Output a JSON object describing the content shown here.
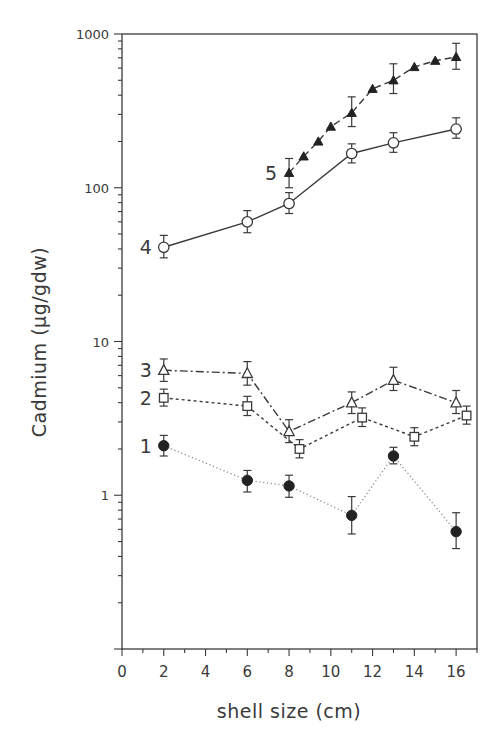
{
  "chart_data": {
    "type": "line",
    "title": "",
    "xlabel": "shell size (cm)",
    "ylabel": "Cadmium (μg/gdw)",
    "xlim": [
      0,
      17
    ],
    "ylim": [
      0.1,
      1000
    ],
    "yscale": "log",
    "grid": false,
    "legend": "inline numeric labels at left of each series",
    "x_ticks": [
      0,
      2,
      4,
      6,
      8,
      10,
      12,
      14,
      16
    ],
    "x_tick_labels": [
      "0",
      "2",
      "4",
      "6",
      "8",
      "10",
      "12",
      "14",
      "16"
    ],
    "y_ticks": [
      1,
      10,
      100,
      1000
    ],
    "y_tick_labels": [
      "1",
      "10",
      "100",
      "1000"
    ],
    "series": [
      {
        "name": "1",
        "marker": "filled-circle",
        "line_style": "sparse-dotted",
        "x": [
          2,
          6,
          8,
          11,
          13,
          16
        ],
        "values": [
          2.1,
          1.25,
          1.15,
          0.74,
          1.8,
          0.58
        ],
        "error_low": [
          1.8,
          1.05,
          0.97,
          0.56,
          1.6,
          0.45
        ],
        "error_high": [
          2.45,
          1.45,
          1.35,
          0.98,
          2.05,
          0.77
        ]
      },
      {
        "name": "2",
        "marker": "open-square",
        "line_style": "dotted",
        "x": [
          2,
          6,
          8.5,
          11.5,
          14,
          16.5
        ],
        "values": [
          4.3,
          3.8,
          2.0,
          3.2,
          2.4,
          3.3
        ],
        "error_low": [
          3.8,
          3.3,
          1.75,
          2.8,
          2.1,
          2.9
        ],
        "error_high": [
          4.9,
          4.4,
          2.3,
          3.7,
          2.75,
          3.8
        ]
      },
      {
        "name": "3",
        "marker": "open-triangle",
        "line_style": "dash-dot",
        "x": [
          2,
          6,
          8,
          11,
          13,
          16
        ],
        "values": [
          6.5,
          6.2,
          2.6,
          4.0,
          5.6,
          4.0
        ],
        "error_low": [
          5.5,
          5.2,
          2.2,
          3.4,
          4.8,
          3.4
        ],
        "error_high": [
          7.7,
          7.4,
          3.1,
          4.7,
          6.8,
          4.8
        ]
      },
      {
        "name": "4",
        "marker": "open-circle",
        "line_style": "solid",
        "x": [
          2,
          6,
          8,
          11,
          13,
          16
        ],
        "values": [
          41,
          60,
          79,
          167,
          196,
          241
        ],
        "error_low": [
          35,
          51,
          68,
          145,
          170,
          210
        ],
        "error_high": [
          49,
          71,
          93,
          193,
          228,
          285
        ]
      },
      {
        "name": "5",
        "marker": "filled-triangle",
        "line_style": "dashed",
        "x": [
          8,
          8.7,
          9.4,
          10,
          11,
          12,
          13,
          14,
          15,
          16
        ],
        "values": [
          125,
          160,
          200,
          250,
          307,
          440,
          500,
          610,
          670,
          710
        ],
        "error_low": [
          100,
          null,
          null,
          null,
          250,
          null,
          410,
          null,
          null,
          590
        ],
        "error_high": [
          155,
          null,
          null,
          null,
          390,
          null,
          640,
          null,
          null,
          870
        ]
      }
    ]
  },
  "axes": {
    "x_title": "shell size (cm)",
    "y_title": "Cadmium (μg/gdw)",
    "x_tick_labels": [
      "0",
      "2",
      "4",
      "6",
      "8",
      "10",
      "12",
      "14",
      "16"
    ],
    "y_tick_labels": [
      "1",
      "10",
      "100",
      "1000"
    ]
  },
  "series_labels": [
    "1",
    "2",
    "3",
    "4",
    "5"
  ],
  "colors": {
    "ink": "#3a3a3a",
    "background": "#ffffff",
    "dotted_series": "#8a8a8a"
  }
}
